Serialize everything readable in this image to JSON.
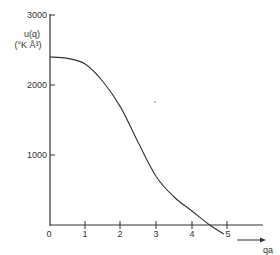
{
  "chart_data": {
    "type": "line",
    "title": "",
    "xlabel": "qa",
    "ylabel": "u(q)",
    "ylabel_units": "(°K Å³)",
    "xlim": [
      0,
      5.9
    ],
    "ylim": [
      -200,
      3000
    ],
    "grid": false,
    "legend": "none",
    "x_ticks": [
      "0",
      "1",
      "2",
      "3",
      "4",
      "5"
    ],
    "y_ticks": [
      "1000",
      "2000",
      "3000"
    ],
    "series": [
      {
        "name": "u(q)",
        "x": [
          0,
          0.5,
          1,
          1.5,
          2,
          2.5,
          3,
          3.5,
          4,
          4.5,
          4.9
        ],
        "values": [
          2400,
          2380,
          2300,
          2050,
          1680,
          1170,
          690,
          400,
          200,
          0,
          -130
        ]
      }
    ],
    "color": "#333333"
  }
}
